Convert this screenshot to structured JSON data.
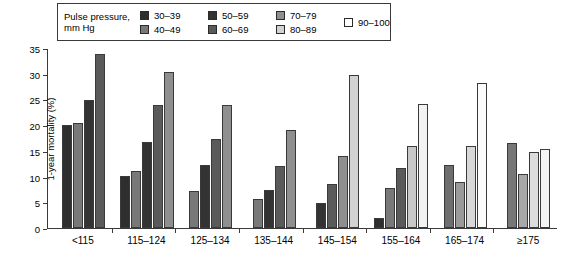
{
  "legend": {
    "title_line1": "Pulse pressure,",
    "title_line2": "mm Hg",
    "entries": [
      {
        "label": "30–39",
        "color": "#2e2e2e"
      },
      {
        "label": "40–49",
        "color": "#787878"
      },
      {
        "label": "50–59",
        "color": "#333333"
      },
      {
        "label": "60–69",
        "color": "#5a5a5a"
      },
      {
        "label": "70–79",
        "color": "#8f8f8f"
      },
      {
        "label": "80–89",
        "color": "#d2d2d2"
      },
      {
        "label": "90–100",
        "color": "#ffffff"
      }
    ]
  },
  "axes": {
    "ylabel": "1-year mortality (%)",
    "xlabel": "Systolic blood pressure (mm Hg)",
    "yticks": [
      "0",
      "5",
      "10",
      "15",
      "20",
      "25",
      "30",
      "35"
    ]
  },
  "chart_data": {
    "type": "bar",
    "title": "",
    "xlabel": "Systolic blood pressure (mm Hg)",
    "ylabel": "1-year mortality (%)",
    "ylim": [
      0,
      35
    ],
    "ytick_step": 5,
    "grid": false,
    "legend_position": "top-left",
    "legend_title": "Pulse pressure, mm Hg",
    "categories": [
      "<115",
      "115–124",
      "125–134",
      "135–144",
      "145–154",
      "155–164",
      "165–174",
      "≥175"
    ],
    "series": [
      {
        "name": "30–39",
        "color": "#2e2e2e",
        "values": [
          20.2,
          10.2,
          null,
          null,
          null,
          2.0,
          null,
          null
        ]
      },
      {
        "name": "40–49",
        "color": "#787878",
        "values": [
          20.6,
          11.2,
          7.3,
          5.6,
          null,
          7.8,
          null,
          null
        ]
      },
      {
        "name": "50–59",
        "color": "#333333",
        "values": [
          25.0,
          16.8,
          12.3,
          7.5,
          4.9,
          11.8,
          12.3,
          16.7
        ]
      },
      {
        "name": "60–69",
        "color": "#5a5a5a",
        "values": [
          34.0,
          24.0,
          17.4,
          12.2,
          8.7,
          null,
          9.0,
          10.5
        ]
      },
      {
        "name": "70–79",
        "color": "#8f8f8f",
        "values": [
          null,
          30.5,
          24.0,
          19.1,
          14.0,
          16.0,
          16.0,
          14.8
        ]
      },
      {
        "name": "80–89",
        "color": "#d2d2d2",
        "values": [
          null,
          null,
          null,
          null,
          30.0,
          24.3,
          28.3,
          15.5
        ]
      },
      {
        "name": "90–100",
        "color": "#ffffff",
        "values": [
          null,
          null,
          null,
          null,
          null,
          null,
          null,
          null
        ]
      }
    ],
    "groups": [
      {
        "category": "<115",
        "bars": [
          {
            "series": "30–39",
            "value": 20.2,
            "color": "#2e2e2e"
          },
          {
            "series": "40–49",
            "value": 20.6,
            "color": "#787878"
          },
          {
            "series": "50–59",
            "value": 25.0,
            "color": "#333333"
          },
          {
            "series": "60–69",
            "value": 34.0,
            "color": "#5a5a5a"
          }
        ]
      },
      {
        "category": "115–124",
        "bars": [
          {
            "series": "30–39",
            "value": 10.2,
            "color": "#2e2e2e"
          },
          {
            "series": "40–49",
            "value": 11.2,
            "color": "#787878"
          },
          {
            "series": "50–59",
            "value": 16.8,
            "color": "#333333"
          },
          {
            "series": "60–69",
            "value": 24.0,
            "color": "#5a5a5a"
          },
          {
            "series": "70–79",
            "value": 30.5,
            "color": "#8f8f8f"
          }
        ]
      },
      {
        "category": "125–134",
        "bars": [
          {
            "series": "40–49",
            "value": 7.3,
            "color": "#787878"
          },
          {
            "series": "50–59",
            "value": 12.3,
            "color": "#333333"
          },
          {
            "series": "60–69",
            "value": 17.4,
            "color": "#5a5a5a"
          },
          {
            "series": "70–79",
            "value": 24.0,
            "color": "#8f8f8f"
          }
        ]
      },
      {
        "category": "135–144",
        "bars": [
          {
            "series": "40–49",
            "value": 5.6,
            "color": "#787878"
          },
          {
            "series": "50–59",
            "value": 7.5,
            "color": "#333333"
          },
          {
            "series": "60–69",
            "value": 12.2,
            "color": "#5a5a5a"
          },
          {
            "series": "70–79",
            "value": 19.1,
            "color": "#8f8f8f"
          }
        ]
      },
      {
        "category": "145–154",
        "bars": [
          {
            "series": "50–59",
            "value": 4.9,
            "color": "#333333"
          },
          {
            "series": "60–69",
            "value": 8.7,
            "color": "#5a5a5a"
          },
          {
            "series": "70–79",
            "value": 14.0,
            "color": "#8f8f8f"
          },
          {
            "series": "80–89",
            "value": 30.0,
            "color": "#d2d2d2"
          }
        ]
      },
      {
        "category": "155–164",
        "bars": [
          {
            "series": "30–39",
            "value": 2.0,
            "color": "#2e2e2e"
          },
          {
            "series": "40–49",
            "value": 7.8,
            "color": "#787878"
          },
          {
            "series": "50–59",
            "value": 11.8,
            "color": "#5a5a5a"
          },
          {
            "series": "70–79",
            "value": 16.0,
            "color": "#c8c8c8"
          },
          {
            "series": "80–89",
            "value": 24.3,
            "color": "#f2f2f2"
          }
        ]
      },
      {
        "category": "165–174",
        "bars": [
          {
            "series": "50–59",
            "value": 12.3,
            "color": "#6e6e6e"
          },
          {
            "series": "60–69",
            "value": 9.0,
            "color": "#9a9a9a"
          },
          {
            "series": "70–79",
            "value": 16.0,
            "color": "#d8d8d8"
          },
          {
            "series": "80–89",
            "value": 28.3,
            "color": "#fbfbfb"
          }
        ]
      },
      {
        "category": "≥175",
        "bars": [
          {
            "series": "50–59",
            "value": 16.7,
            "color": "#777777"
          },
          {
            "series": "60–69",
            "value": 10.5,
            "color": "#a8a8a8"
          },
          {
            "series": "70–79",
            "value": 14.8,
            "color": "#dcdcdc"
          },
          {
            "series": "80–89",
            "value": 15.5,
            "color": "#f4f4f4"
          }
        ]
      }
    ]
  }
}
